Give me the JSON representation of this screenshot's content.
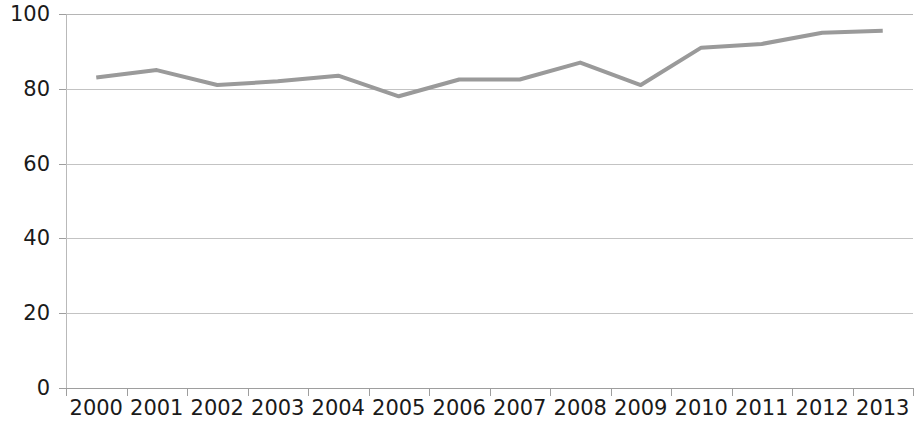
{
  "chart_data": {
    "type": "line",
    "title": "",
    "subtitle": "",
    "xlabel": "",
    "ylabel": "",
    "categories": [
      "2000",
      "2001",
      "2002",
      "2003",
      "2004",
      "2005",
      "2006",
      "2007",
      "2008",
      "2009",
      "2010",
      "2011",
      "2012",
      "2013"
    ],
    "series": [
      {
        "name": "",
        "color": "#9a9a9a",
        "values": [
          83,
          85,
          81,
          82,
          83.5,
          78,
          82.5,
          82.5,
          87,
          81,
          91,
          92,
          95,
          95.5
        ]
      }
    ],
    "ylim": [
      0,
      100
    ],
    "yticks": [
      0,
      20,
      40,
      60,
      80,
      100
    ],
    "ytick_labels": [
      "0",
      "20",
      "40",
      "60",
      "80",
      "100"
    ],
    "grid": true,
    "grid_axis": "y",
    "legend": false,
    "legend_position": "none",
    "markers": false,
    "line_width": 4,
    "background": "#ffffff",
    "grid_color": "#c3c3c3",
    "axis_color": "#9e9e9e",
    "text_color": "#1a1a1a"
  }
}
